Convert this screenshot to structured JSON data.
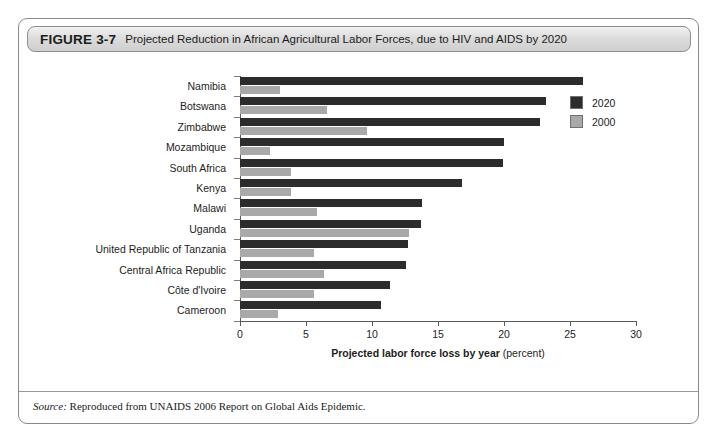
{
  "figure": {
    "number": "FIGURE 3-7",
    "caption": "Projected Reduction in African Agricultural Labor Forces, due to HIV and AIDS by 2020",
    "source_keyword": "Source:",
    "source_text": "Reproduced from UNAIDS 2006 Report on Global Aids Epidemic."
  },
  "axis": {
    "x_title_strong": "Projected labor force loss by year",
    "x_title_light": "(percent)",
    "x_ticks": [
      "0",
      "5",
      "10",
      "15",
      "20",
      "25",
      "30"
    ]
  },
  "legend": {
    "entries": [
      {
        "label": "2020",
        "color": "#2c2c2c"
      },
      {
        "label": "2000",
        "color": "#a9a9a9"
      }
    ]
  },
  "colors": {
    "series_2020": "#2c2c2c",
    "series_2000": "#a9a9a9",
    "frame": "#8a8a8a",
    "axis": "#5a5a5a"
  },
  "chart_data": {
    "type": "bar",
    "orientation": "horizontal",
    "title": "Projected Reduction in African Agricultural Labor Forces, due to HIV and AIDS by 2020",
    "xlabel": "Projected labor force loss by year (percent)",
    "ylabel": "",
    "xlim": [
      0,
      30
    ],
    "xticks": [
      0,
      5,
      10,
      15,
      20,
      25,
      30
    ],
    "grid": false,
    "legend_position": "top-right",
    "categories": [
      "Namibia",
      "Botswana",
      "Zimbabwe",
      "Mozambique",
      "South Africa",
      "Kenya",
      "Malawi",
      "Uganda",
      "United Republic of Tanzania",
      "Central Africa Republic",
      "Côte d'Ivoire",
      "Cameroon"
    ],
    "series": [
      {
        "name": "2020",
        "color": "#2c2c2c",
        "values": [
          26.0,
          23.2,
          22.7,
          20.0,
          19.9,
          16.8,
          13.8,
          13.7,
          12.7,
          12.6,
          11.4,
          10.7
        ]
      },
      {
        "name": "2000",
        "color": "#a9a9a9",
        "values": [
          3.0,
          6.6,
          9.6,
          2.3,
          3.9,
          3.9,
          5.8,
          12.8,
          5.6,
          6.4,
          5.6,
          2.9
        ]
      }
    ]
  }
}
